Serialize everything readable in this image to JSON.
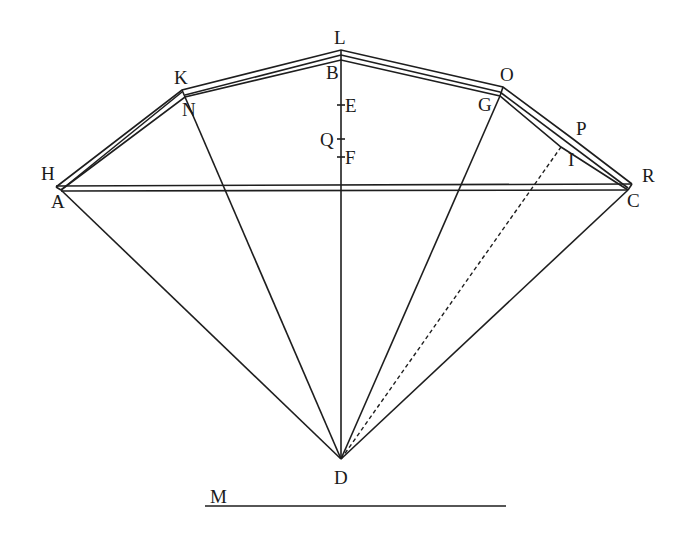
{
  "diagram": {
    "type": "geometric construction",
    "labels": {
      "H": "H",
      "A": "A",
      "K": "K",
      "N": "N",
      "L": "L",
      "B": "B",
      "E": "E",
      "Q": "Q",
      "F": "F",
      "O": "O",
      "G": "G",
      "P": "P",
      "I": "I",
      "R": "R",
      "C": "C",
      "D": "D",
      "M": "M"
    },
    "points": {
      "H": [
        56,
        187
      ],
      "A": [
        61,
        190
      ],
      "K": [
        182,
        90
      ],
      "N": [
        185,
        97
      ],
      "L": [
        341,
        50
      ],
      "B": [
        341,
        60
      ],
      "O": [
        503,
        87
      ],
      "G": [
        500,
        96
      ],
      "P": [
        573,
        139
      ],
      "I": [
        561,
        147
      ],
      "R": [
        632,
        184
      ],
      "C": [
        628,
        190
      ],
      "D": [
        341,
        459
      ],
      "E": [
        341,
        105
      ],
      "Q": [
        341,
        139
      ],
      "F": [
        341,
        157
      ]
    },
    "outer_polygon": [
      "H",
      "K",
      "L",
      "O",
      "P",
      "R"
    ],
    "inner_polygon": [
      "A",
      "N",
      "B",
      "G",
      "I",
      "C"
    ],
    "chords": [
      [
        "H",
        "R"
      ],
      [
        "A",
        "C"
      ]
    ],
    "radii_solid": [
      [
        "D",
        "A"
      ],
      [
        "D",
        "N"
      ],
      [
        "D",
        "L"
      ],
      [
        "D",
        "G"
      ],
      [
        "D",
        "C"
      ]
    ],
    "radii_dashed": [
      [
        "D",
        "I"
      ]
    ],
    "scale_line": {
      "label": "M",
      "from": [
        205,
        506
      ],
      "to": [
        506,
        506
      ]
    }
  }
}
